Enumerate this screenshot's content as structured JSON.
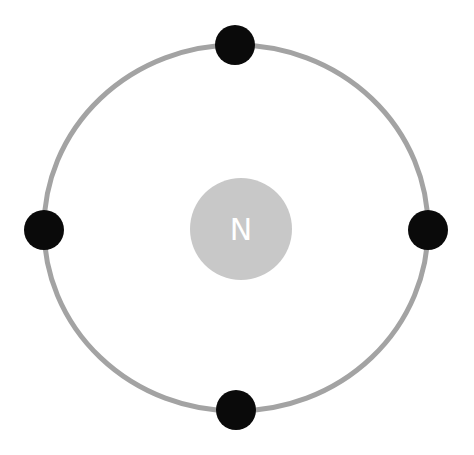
{
  "diagram": {
    "nucleus": {
      "label": "N",
      "color": "#c8c8c8",
      "label_color": "#ffffff"
    },
    "orbit": {
      "color": "#a3a3a3"
    },
    "electrons": [
      {
        "position": "top",
        "color": "#0a0a0a"
      },
      {
        "position": "left",
        "color": "#0a0a0a"
      },
      {
        "position": "right",
        "color": "#0a0a0a"
      },
      {
        "position": "bottom",
        "color": "#0a0a0a"
      }
    ],
    "electron_count": 4
  }
}
